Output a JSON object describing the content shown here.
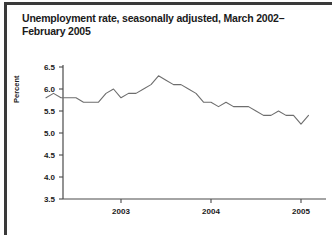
{
  "figure": {
    "title": "Unemployment rate, seasonally adjusted, March 2002–February 2005",
    "caption": ""
  },
  "chart_data": {
    "type": "line",
    "title": "Unemployment rate, seasonally adjusted, March 2002–February 2005",
    "xlabel": "",
    "ylabel": "Percent",
    "ylim": [
      3.5,
      6.5
    ],
    "ytick_labels": [
      "6.5",
      "6.0",
      "5.5",
      "5.0",
      "4.5",
      "4.0",
      "3.5"
    ],
    "yticks": [
      6.5,
      6.0,
      5.5,
      5.0,
      4.5,
      4.0,
      3.5
    ],
    "xtick_labels": [
      "2003",
      "2004",
      "2005"
    ],
    "xticks": [
      "2003-01",
      "2004-01",
      "2005-01"
    ],
    "grid": false,
    "legend": "none",
    "x": [
      "2002-03",
      "2002-04",
      "2002-05",
      "2002-06",
      "2002-07",
      "2002-08",
      "2002-09",
      "2002-10",
      "2002-11",
      "2002-12",
      "2003-01",
      "2003-02",
      "2003-03",
      "2003-04",
      "2003-05",
      "2003-06",
      "2003-07",
      "2003-08",
      "2003-09",
      "2003-10",
      "2003-11",
      "2003-12",
      "2004-01",
      "2004-02",
      "2004-03",
      "2004-04",
      "2004-05",
      "2004-06",
      "2004-07",
      "2004-08",
      "2004-09",
      "2004-10",
      "2004-11",
      "2004-12",
      "2005-01",
      "2005-02"
    ],
    "values": [
      5.8,
      5.9,
      5.8,
      5.8,
      5.8,
      5.7,
      5.7,
      5.7,
      5.9,
      6.0,
      5.8,
      5.9,
      5.9,
      6.0,
      6.1,
      6.3,
      6.2,
      6.1,
      6.1,
      6.0,
      5.9,
      5.7,
      5.7,
      5.6,
      5.7,
      5.6,
      5.6,
      5.6,
      5.5,
      5.4,
      5.4,
      5.5,
      5.4,
      5.4,
      5.2,
      5.4
    ],
    "series_label": "Unemployment rate"
  }
}
